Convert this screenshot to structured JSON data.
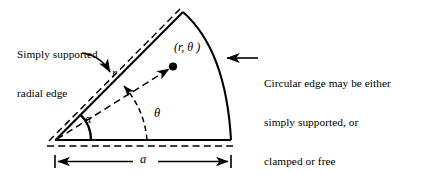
{
  "figure": {
    "colors": {
      "stroke": "#000000",
      "background": "#ffffff"
    },
    "annotations": {
      "left_label": {
        "line1": "Simply supported",
        "line2": "radial edge",
        "full": "Simply supported radial edge"
      },
      "right_label": {
        "line1": "Circular edge may be either",
        "line2": "simply supported, or",
        "line3": "clamped or free",
        "full": "Circular edge may be either simply supported, or clamped or free"
      },
      "point_label": "(r, θ )",
      "radius_label": "r",
      "alpha_label": "α",
      "theta_label": "θ",
      "dimension_label": "a"
    },
    "geometry": {
      "apex": {
        "x": 55,
        "y": 140
      },
      "arc_top_end": {
        "x": 183,
        "y": 12
      },
      "arc_bottom_end": {
        "x": 231,
        "y": 140
      },
      "point": {
        "x": 173,
        "y": 66
      },
      "sector_radius": 176,
      "alpha_deg": 45,
      "theta_deg": 33
    }
  }
}
